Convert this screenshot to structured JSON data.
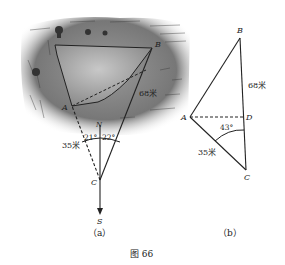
{
  "figure_caption": "图 66",
  "panel_a": {
    "caption": "（a）",
    "points": {
      "A": "A",
      "B": "B",
      "C": "C",
      "N": "N",
      "S": "S"
    },
    "distance_AC": "35米",
    "distance_BD": "68米",
    "angle_left": "21°",
    "angle_right": "22°"
  },
  "panel_b": {
    "caption": "（b）",
    "points": {
      "A": "A",
      "B": "B",
      "C": "C",
      "D": "D"
    },
    "distance_BC": "68米",
    "distance_AC": "35米",
    "angle_ACB": "43°"
  },
  "colors": {
    "line": "#222222",
    "landscape_dark": "#6b6b6b",
    "landscape_light": "#bdbdbd",
    "background": "#ffffff"
  }
}
